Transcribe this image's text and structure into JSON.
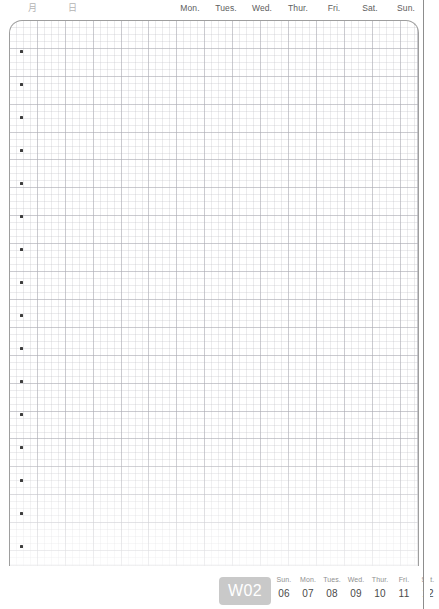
{
  "header": {
    "month_label": "月",
    "day_label": "日",
    "weekdays": [
      "Mon.",
      "Tues.",
      "Wed.",
      "Thur.",
      "Fri.",
      "Sat.",
      "Sun."
    ]
  },
  "sheet": {
    "bullet_count": 16,
    "bullet_start_y": 50,
    "bullet_spacing": 33,
    "grid_minor_px": 7,
    "grid_major_px": 28,
    "border_color": "#9e9e9e",
    "grid_color": "#aaaab2"
  },
  "footer": {
    "week_badge": "W02",
    "badge_color": "#c9c9c9",
    "days": [
      {
        "name": "Sun.",
        "date": "06"
      },
      {
        "name": "Mon.",
        "date": "07"
      },
      {
        "name": "Tues.",
        "date": "08"
      },
      {
        "name": "Wed.",
        "date": "09"
      },
      {
        "name": "Thur.",
        "date": "10"
      },
      {
        "name": "Fri.",
        "date": "11"
      },
      {
        "name": "Sat.",
        "date": "12"
      }
    ]
  }
}
